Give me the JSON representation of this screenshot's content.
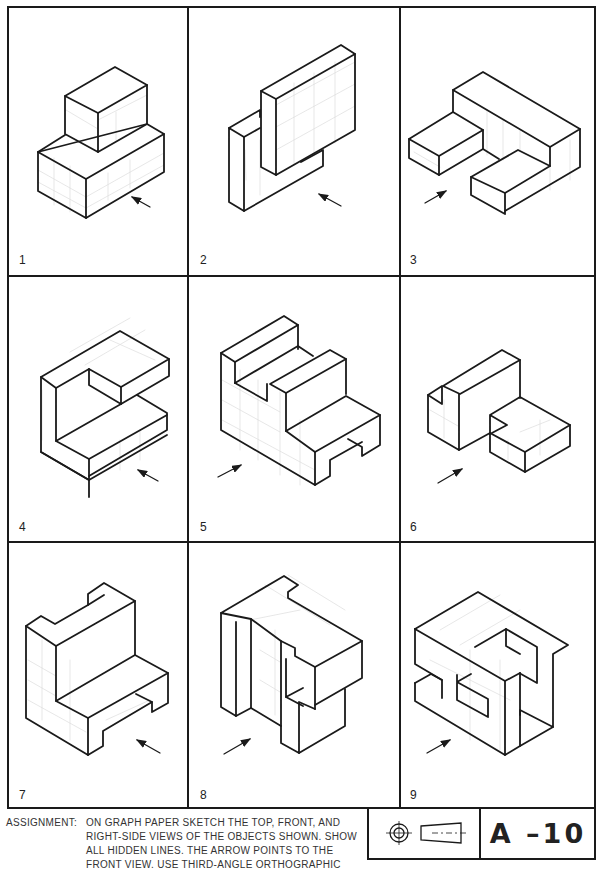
{
  "sheet": {
    "panels": [
      {
        "number": "1",
        "arrow_direction": "up-left"
      },
      {
        "number": "2",
        "arrow_direction": "up-left"
      },
      {
        "number": "3",
        "arrow_direction": "up-right"
      },
      {
        "number": "4",
        "arrow_direction": "up-left"
      },
      {
        "number": "5",
        "arrow_direction": "up-right"
      },
      {
        "number": "6",
        "arrow_direction": "up-right"
      },
      {
        "number": "7",
        "arrow_direction": "up-left"
      },
      {
        "number": "8",
        "arrow_direction": "up-right"
      },
      {
        "number": "9",
        "arrow_direction": "up-right"
      }
    ]
  },
  "assignment": {
    "label": "ASSIGNMENT:",
    "lines": [
      "ON GRAPH PAPER SKETCH THE TOP, FRONT, AND",
      "RIGHT-SIDE VIEWS OF THE OBJECTS SHOWN. SHOW",
      "ALL HIDDEN LINES. THE ARROW POINTS TO THE",
      "FRONT  VIEW. USE THIRD-ANGLE ORTHOGRAPHIC"
    ]
  },
  "title_block": {
    "projection_symbol": "third-angle-projection-icon",
    "code": "A –10"
  },
  "colors": {
    "ink": "#1a1a1a",
    "grid": "#d8d8d8",
    "paper": "#ffffff"
  }
}
